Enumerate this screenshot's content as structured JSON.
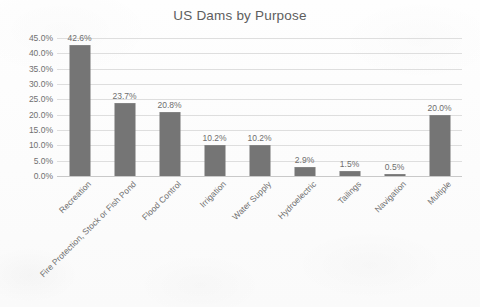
{
  "chart_data": {
    "type": "bar",
    "title": "US Dams by Purpose",
    "xlabel": "",
    "ylabel": "",
    "categories": [
      "Recreation",
      "Fire Protection, Stock or Fish Pond",
      "Flood Control",
      "Irrigation",
      "Water Supply",
      "Hydroelectric",
      "Tailings",
      "Navigation",
      "Multiple"
    ],
    "values": [
      42.6,
      23.7,
      20.8,
      10.2,
      10.2,
      2.9,
      1.5,
      0.5,
      20.0
    ],
    "value_labels": [
      "42.6%",
      "23.7%",
      "20.8%",
      "10.2%",
      "10.2%",
      "2.9%",
      "1.5%",
      "0.5%",
      "20.0%"
    ],
    "ylim": [
      0,
      45
    ],
    "ytick_labels": [
      "45.0%",
      "40.0%",
      "35.0%",
      "30.0%",
      "25.0%",
      "20.0%",
      "15.0%",
      "10.0%",
      "5.0%",
      "0.0%"
    ],
    "ytick_values": [
      45,
      40,
      35,
      30,
      25,
      20,
      15,
      10,
      5,
      0
    ],
    "grid": true,
    "legend": "none",
    "bar_color": "#757575",
    "gridline_color": "#dedede",
    "text_color": "#6f6f6f",
    "background_color": "#fdfdfd"
  }
}
